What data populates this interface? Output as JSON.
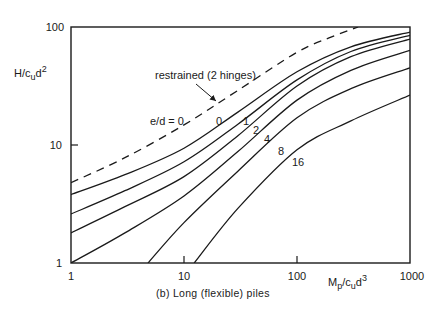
{
  "chart_data": {
    "type": "line",
    "title": "",
    "caption": "(b) Long (flexible) piles",
    "xlabel": "Mp/cud3",
    "ylabel": "H/cud2",
    "xscale": "log",
    "yscale": "log",
    "xlim": [
      1,
      1000
    ],
    "ylim": [
      1,
      100
    ],
    "xticks": [
      1,
      10,
      100,
      1000
    ],
    "xtick_labels": [
      "1",
      "10",
      "100",
      "1000"
    ],
    "yticks": [
      1,
      10,
      100
    ],
    "ytick_labels": [
      "1",
      "10",
      "100"
    ],
    "grid": false,
    "legend": "none (curves labeled inline)",
    "inline_prefix": "e/d = ",
    "series": [
      {
        "name": "restrained (2 hinges)",
        "style": "dashed",
        "label": "0",
        "x": [
          1,
          3,
          10,
          30,
          100,
          200,
          347
        ],
        "y": [
          4.8,
          7.8,
          14.8,
          29,
          61,
          82,
          100
        ]
      },
      {
        "name": "e/d = 0",
        "style": "solid",
        "label": "0",
        "x": [
          1,
          3,
          10,
          30,
          100,
          300,
          1000
        ],
        "y": [
          3.8,
          5.6,
          9.4,
          19,
          41.7,
          68,
          90.6
        ]
      },
      {
        "name": "e/d = 1",
        "style": "solid",
        "label": "1",
        "x": [
          1,
          3,
          10,
          30,
          100,
          300,
          1000
        ],
        "y": [
          2.6,
          4.1,
          7.2,
          15,
          35.6,
          62,
          85
        ]
      },
      {
        "name": "e/d = 2",
        "style": "solid",
        "label": "2",
        "x": [
          1,
          3,
          10,
          30,
          100,
          300,
          1000
        ],
        "y": [
          1.8,
          3,
          5.4,
          12,
          31.6,
          56,
          79
        ]
      },
      {
        "name": "e/d = 4",
        "style": "solid",
        "label": "4",
        "x": [
          1,
          3,
          10,
          30,
          100,
          300,
          1000
        ],
        "y": [
          1.0,
          1.8,
          3.7,
          8.8,
          24,
          43,
          63.5
        ]
      },
      {
        "name": "e/d = 8",
        "style": "solid",
        "label": "8",
        "x": [
          4.8,
          10,
          30,
          100,
          300,
          1000
        ],
        "y": [
          1.0,
          2.2,
          6,
          17,
          30,
          45
        ]
      },
      {
        "name": "e/d = 16",
        "style": "solid",
        "label": "16",
        "x": [
          12.3,
          30,
          100,
          300,
          1000
        ],
        "y": [
          1.0,
          2.9,
          9.1,
          16,
          26.5
        ]
      }
    ],
    "annotations": [
      {
        "text": "restrained (2 hinges)",
        "arrow_to_series": "restrained (2 hinges)"
      },
      {
        "text": "e/d = 0"
      }
    ]
  },
  "labels": {
    "y_axis_main": "H/c",
    "y_axis_sub": "u",
    "y_axis_rest": "d",
    "y_axis_sup": "2",
    "x_axis_main": "M",
    "x_axis_sub1": "p",
    "x_axis_mid": "/c",
    "x_axis_sub2": "u",
    "x_axis_rest": "d",
    "x_axis_sup": "3",
    "caption": "(b) Long (flexible) piles",
    "restrained": "restrained (2 hinges)",
    "ed_prefix": "e/d = 0",
    "ed_0": "0",
    "ed_1": "1",
    "ed_2": "2",
    "ed_4": "4",
    "ed_8": "8",
    "ed_16": "16"
  },
  "ticks": {
    "x": [
      "1",
      "10",
      "100",
      "1000"
    ],
    "y": [
      "1",
      "10",
      "100"
    ]
  }
}
